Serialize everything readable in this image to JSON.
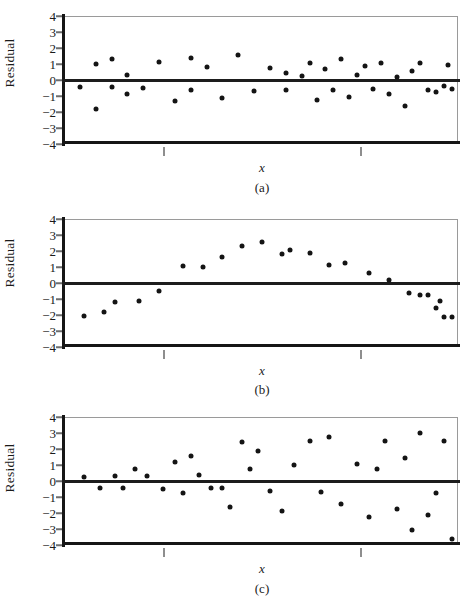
{
  "figure": {
    "ylabel": "Residual",
    "xlabel": "x",
    "y_ticks": [
      "4",
      "3",
      "2",
      "1",
      "0",
      "−1",
      "−2",
      "−3",
      "−4"
    ],
    "captions": [
      "(a)",
      "(b)",
      "(c)"
    ],
    "colors": {
      "point": "#141414",
      "zero_line": "#1d1d1d",
      "axis_spine": "#161616",
      "frame_light": "#9a9a9a",
      "tick": "#8e8e8e",
      "background": "#ffffff"
    }
  },
  "chart_data": [
    {
      "type": "scatter",
      "panel": "a",
      "title": "",
      "xlabel": "x",
      "ylabel": "Residual",
      "ylim": [
        -4,
        4
      ],
      "yticks": [
        4,
        3,
        2,
        1,
        0,
        -1,
        -2,
        -3,
        -4
      ],
      "xticks_labeled": false,
      "xtick_count": 2,
      "grid": false,
      "legend": null,
      "annotation": "random scatter about zero — constant variance, no pattern",
      "reference_line_y": 0,
      "x": [
        0.045,
        0.085,
        0.085,
        0.125,
        0.125,
        0.165,
        0.165,
        0.205,
        0.245,
        0.285,
        0.325,
        0.325,
        0.365,
        0.405,
        0.445,
        0.485,
        0.525,
        0.565,
        0.565,
        0.605,
        0.625,
        0.645,
        0.665,
        0.685,
        0.705,
        0.725,
        0.745,
        0.765,
        0.785,
        0.805,
        0.825,
        0.845,
        0.865,
        0.885,
        0.905,
        0.925,
        0.945,
        0.965,
        0.975,
        0.985
      ],
      "y": [
        -0.42,
        1.0,
        -1.82,
        1.3,
        -0.44,
        0.32,
        -0.9,
        -0.52,
        1.14,
        -1.3,
        1.4,
        -0.65,
        0.84,
        -1.12,
        1.58,
        -0.66,
        0.74,
        0.46,
        -0.6,
        0.22,
        1.05,
        -1.24,
        0.68,
        -0.6,
        1.32,
        -1.06,
        0.32,
        0.88,
        -0.54,
        1.06,
        -0.85,
        0.16,
        -1.62,
        0.56,
        1.07,
        -0.6,
        -0.74,
        -0.35,
        0.95,
        -0.55
      ]
    },
    {
      "type": "scatter",
      "panel": "b",
      "title": "",
      "xlabel": "x",
      "ylabel": "Residual",
      "ylim": [
        -4,
        4
      ],
      "yticks": [
        4,
        3,
        2,
        1,
        0,
        -1,
        -2,
        -3,
        -4
      ],
      "xticks_labeled": false,
      "xtick_count": 2,
      "grid": false,
      "legend": null,
      "annotation": "curved (parabolic) pattern — indicates a nonlinear relationship",
      "reference_line_y": 0,
      "x": [
        0.055,
        0.105,
        0.135,
        0.195,
        0.245,
        0.305,
        0.355,
        0.405,
        0.455,
        0.505,
        0.555,
        0.575,
        0.625,
        0.675,
        0.715,
        0.775,
        0.825,
        0.875,
        0.905,
        0.925,
        0.945,
        0.955,
        0.965,
        0.985
      ],
      "y": [
        -2.05,
        -1.82,
        -1.18,
        -1.12,
        -0.48,
        1.08,
        1.0,
        1.6,
        2.3,
        2.58,
        1.8,
        2.05,
        1.88,
        1.14,
        1.22,
        0.62,
        0.18,
        -0.62,
        -0.72,
        -0.78,
        -1.55,
        -1.15,
        -2.15,
        -2.15
      ]
    },
    {
      "type": "scatter",
      "panel": "c",
      "title": "",
      "xlabel": "x",
      "ylabel": "Residual",
      "ylim": [
        -4,
        4
      ],
      "yticks": [
        4,
        3,
        2,
        1,
        0,
        -1,
        -2,
        -3,
        -4
      ],
      "xticks_labeled": false,
      "xtick_count": 2,
      "grid": false,
      "legend": null,
      "annotation": "funnel / fan pattern — variance increases with x (heteroscedasticity)",
      "reference_line_y": 0,
      "x": [
        0.055,
        0.095,
        0.135,
        0.155,
        0.185,
        0.215,
        0.255,
        0.285,
        0.305,
        0.325,
        0.345,
        0.375,
        0.405,
        0.425,
        0.455,
        0.475,
        0.495,
        0.525,
        0.555,
        0.585,
        0.625,
        0.655,
        0.675,
        0.705,
        0.745,
        0.775,
        0.795,
        0.815,
        0.845,
        0.865,
        0.885,
        0.905,
        0.925,
        0.945,
        0.965,
        0.985
      ],
      "y": [
        0.26,
        -0.46,
        0.34,
        -0.42,
        0.72,
        0.34,
        -0.5,
        1.18,
        -0.78,
        1.56,
        0.36,
        -0.46,
        -0.46,
        -1.6,
        2.46,
        0.72,
        1.88,
        -0.64,
        -1.9,
        1.02,
        2.48,
        -0.68,
        2.72,
        -1.44,
        1.08,
        -2.26,
        0.74,
        2.52,
        -1.76,
        1.44,
        -3.06,
        3.02,
        -2.1,
        -0.78,
        2.48,
        -3.62
      ]
    }
  ]
}
